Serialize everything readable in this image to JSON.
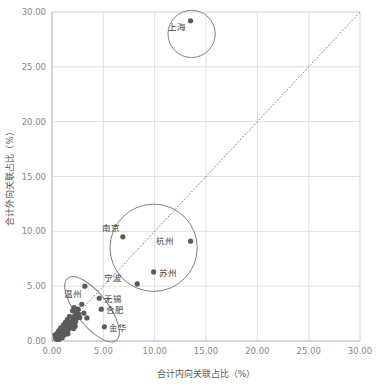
{
  "chart_data": {
    "type": "scatter",
    "title": "",
    "xlabel": "合计内向关联占比（%）",
    "ylabel": "合计外向关联占比（%）",
    "xlim": [
      0,
      30
    ],
    "ylim": [
      0,
      30
    ],
    "xticks": [
      "0.00",
      "5.00",
      "10.00",
      "15.00",
      "20.00",
      "25.00",
      "30.00"
    ],
    "yticks": [
      "0.00",
      "5.00",
      "10.00",
      "15.00",
      "20.00",
      "25.00",
      "30.00"
    ],
    "xtick_values": [
      0,
      5,
      10,
      15,
      20,
      25,
      30
    ],
    "ytick_values": [
      0,
      5,
      10,
      15,
      20,
      25,
      30
    ],
    "grid": true,
    "legend": "none",
    "marker_color": "#5a5a5a",
    "grid_color": "#e0e0e0",
    "annotation_color": "#808080",
    "reference_line": {
      "type": "dotted-diagonal",
      "label": "y = x",
      "from": [
        0,
        0
      ],
      "to": [
        30,
        30
      ]
    },
    "labeled_points": [
      {
        "name": "上海",
        "x": 13.5,
        "y": 29.2,
        "label_dx": -13,
        "label_dy": 9
      },
      {
        "name": "南京",
        "x": 6.9,
        "y": 9.5,
        "label_dx": -11,
        "label_dy": -6
      },
      {
        "name": "杭州",
        "x": 13.5,
        "y": 9.1,
        "label_dx": -25,
        "label_dy": 3
      },
      {
        "name": "苏州",
        "x": 9.9,
        "y": 6.3,
        "label_dx": 5,
        "label_dy": 4
      },
      {
        "name": "宁波",
        "x": 8.3,
        "y": 5.2,
        "label_dx": -23,
        "label_dy": -3
      },
      {
        "name": "温州",
        "x": 3.2,
        "y": 5.0,
        "label_dx": -11,
        "label_dy": 11
      },
      {
        "name": "无锡",
        "x": 4.6,
        "y": 3.9,
        "label_dx": 5,
        "label_dy": 4
      },
      {
        "name": "合肥",
        "x": 4.8,
        "y": 2.9,
        "label_dx": 5,
        "label_dy": 4
      },
      {
        "name": "金华",
        "x": 5.1,
        "y": 1.3,
        "label_dx": 5,
        "label_dy": 4
      }
    ],
    "unlabeled_points": [
      {
        "x": 0.35,
        "y": 0.25
      },
      {
        "x": 0.55,
        "y": 0.45
      },
      {
        "x": 0.75,
        "y": 0.35
      },
      {
        "x": 0.5,
        "y": 0.7
      },
      {
        "x": 0.9,
        "y": 0.6
      },
      {
        "x": 0.65,
        "y": 0.95
      },
      {
        "x": 1.05,
        "y": 0.85
      },
      {
        "x": 0.85,
        "y": 1.2
      },
      {
        "x": 1.25,
        "y": 1.05
      },
      {
        "x": 1.1,
        "y": 1.45
      },
      {
        "x": 1.45,
        "y": 1.3
      },
      {
        "x": 1.3,
        "y": 1.7
      },
      {
        "x": 1.65,
        "y": 1.5
      },
      {
        "x": 1.5,
        "y": 1.95
      },
      {
        "x": 1.85,
        "y": 1.75
      },
      {
        "x": 2.05,
        "y": 2.0
      },
      {
        "x": 1.7,
        "y": 2.25
      },
      {
        "x": 2.2,
        "y": 2.3
      },
      {
        "x": 2.45,
        "y": 2.1
      },
      {
        "x": 2.0,
        "y": 2.75
      },
      {
        "x": 2.35,
        "y": 2.6
      },
      {
        "x": 2.6,
        "y": 2.45
      },
      {
        "x": 2.15,
        "y": 3.05
      },
      {
        "x": 2.55,
        "y": 2.9
      },
      {
        "x": 1.95,
        "y": 1.55
      },
      {
        "x": 2.25,
        "y": 1.35
      },
      {
        "x": 0.45,
        "y": 0.15
      },
      {
        "x": 0.7,
        "y": 0.15
      },
      {
        "x": 1.0,
        "y": 0.3
      },
      {
        "x": 1.2,
        "y": 0.55
      },
      {
        "x": 1.4,
        "y": 0.8
      },
      {
        "x": 1.6,
        "y": 1.05
      },
      {
        "x": 1.8,
        "y": 1.2
      },
      {
        "x": 2.3,
        "y": 1.75
      },
      {
        "x": 2.7,
        "y": 2.15
      },
      {
        "x": 3.4,
        "y": 2.1
      },
      {
        "x": 2.9,
        "y": 3.35
      },
      {
        "x": 3.1,
        "y": 2.55
      },
      {
        "x": 0.3,
        "y": 0.55
      },
      {
        "x": 0.95,
        "y": 1.0
      },
      {
        "x": 1.15,
        "y": 0.9
      },
      {
        "x": 2.1,
        "y": 1.15
      },
      {
        "x": 0.6,
        "y": 0.25
      },
      {
        "x": 1.35,
        "y": 1.15
      },
      {
        "x": 1.55,
        "y": 0.65
      }
    ],
    "annotations": [
      {
        "shape": "circle",
        "name": "shanghai-cluster-circle",
        "cx": 13.6,
        "cy": 28.0,
        "r": 2.3
      },
      {
        "shape": "circle",
        "name": "core-cities-cluster-circle",
        "cx": 9.9,
        "cy": 8.5,
        "r": 4.25
      },
      {
        "shape": "ellipse",
        "name": "secondary-cities-cluster-ellipse",
        "cx": 3.9,
        "cy": 2.9,
        "rx": 1.55,
        "ry": 3.6,
        "rotate": -38
      }
    ]
  }
}
